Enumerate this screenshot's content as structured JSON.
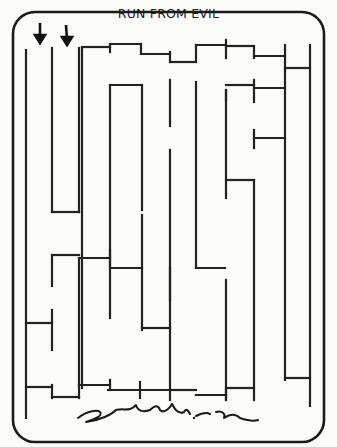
{
  "title": "RUN FROM EVIL",
  "colors": {
    "ink": "#222222",
    "paper": "#fbfbfa"
  },
  "entrances": [
    {
      "label": "entrance-arrow-1",
      "x": 40,
      "y1": 22,
      "y2": 42
    },
    {
      "label": "entrance-arrow-2",
      "x": 67,
      "y1": 24,
      "y2": 44
    }
  ],
  "frame": {
    "x": 13,
    "y": 12,
    "w": 311,
    "h": 430,
    "r": 22
  },
  "walls": [
    [
      26,
      50,
      26,
      418
    ],
    [
      52,
      48,
      52,
      212
    ],
    [
      52,
      212,
      79,
      212
    ],
    [
      79,
      48,
      79,
      212
    ],
    [
      82,
      48,
      82,
      388
    ],
    [
      82,
      47,
      110,
      47
    ],
    [
      110,
      45,
      110,
      52
    ],
    [
      110,
      44,
      141,
      44
    ],
    [
      141,
      44,
      141,
      54
    ],
    [
      141,
      54,
      170,
      54
    ],
    [
      170,
      52,
      170,
      62
    ],
    [
      170,
      62,
      196,
      62
    ],
    [
      196,
      45,
      196,
      62
    ],
    [
      196,
      45,
      226,
      45
    ],
    [
      226,
      40,
      226,
      58
    ],
    [
      226,
      46,
      254,
      46
    ],
    [
      254,
      48,
      254,
      58
    ],
    [
      254,
      56,
      285,
      56
    ],
    [
      285,
      45,
      285,
      70
    ],
    [
      285,
      68,
      310,
      68
    ],
    [
      310,
      45,
      310,
      406
    ],
    [
      285,
      70,
      285,
      380
    ],
    [
      285,
      378,
      310,
      378
    ],
    [
      110,
      85,
      110,
      318
    ],
    [
      110,
      85,
      142,
      85
    ],
    [
      142,
      85,
      142,
      210
    ],
    [
      170,
      80,
      170,
      126
    ],
    [
      170,
      150,
      170,
      400
    ],
    [
      196,
      82,
      196,
      268
    ],
    [
      196,
      268,
      225,
      268
    ],
    [
      226,
      85,
      254,
      85
    ],
    [
      254,
      80,
      254,
      102
    ],
    [
      254,
      88,
      285,
      88
    ],
    [
      226,
      90,
      226,
      198
    ],
    [
      226,
      90,
      226,
      100
    ],
    [
      226,
      180,
      254,
      180
    ],
    [
      254,
      180,
      254,
      400
    ],
    [
      254,
      138,
      285,
      138
    ],
    [
      254,
      130,
      254,
      148
    ],
    [
      142,
      215,
      142,
      330
    ],
    [
      142,
      328,
      170,
      328
    ],
    [
      52,
      255,
      79,
      255
    ],
    [
      52,
      255,
      52,
      286
    ],
    [
      79,
      258,
      79,
      385
    ],
    [
      79,
      258,
      110,
      258
    ],
    [
      110,
      250,
      110,
      266
    ],
    [
      110,
      268,
      142,
      268
    ],
    [
      26,
      323,
      52,
      323
    ],
    [
      52,
      310,
      52,
      350
    ],
    [
      26,
      387,
      52,
      387
    ],
    [
      52,
      385,
      52,
      398
    ],
    [
      52,
      397,
      79,
      397
    ],
    [
      79,
      385,
      79,
      398
    ],
    [
      79,
      385,
      110,
      385
    ],
    [
      110,
      380,
      110,
      390
    ],
    [
      108,
      390,
      140,
      390
    ],
    [
      140,
      382,
      140,
      398
    ],
    [
      140,
      390,
      170,
      390
    ],
    [
      170,
      390,
      196,
      390
    ],
    [
      196,
      395,
      226,
      395
    ],
    [
      226,
      390,
      226,
      400
    ],
    [
      226,
      388,
      254,
      388
    ],
    [
      170,
      268,
      170,
      300
    ],
    [
      226,
      280,
      226,
      400
    ]
  ]
}
